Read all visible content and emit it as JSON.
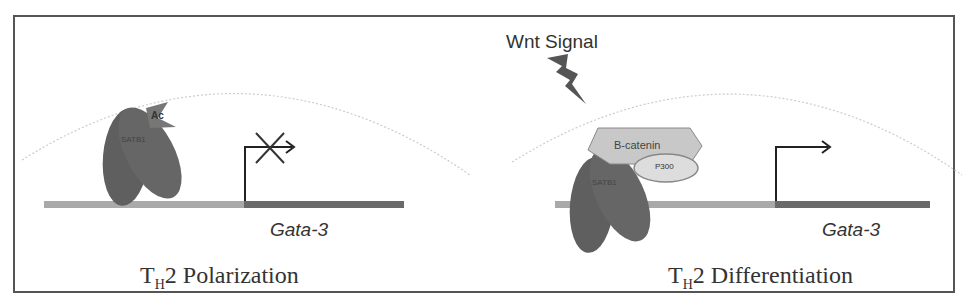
{
  "diagram": {
    "left_panel": {
      "title_prefix": "T",
      "title_sub": "H",
      "title_suffix": "2 Polarization",
      "protein_label": "SATB1",
      "modification_label": "Ac",
      "gene_label": "Gata-3",
      "transcription": "blocked"
    },
    "right_panel": {
      "title_prefix": "T",
      "title_sub": "H",
      "title_suffix": "2 Differentiation",
      "signal_label": "Wnt Signal",
      "protein_label": "SATB1",
      "cofactor_label": "B-catenin",
      "coactivator_label": "P300",
      "gene_label": "Gata-3",
      "transcription": "active"
    },
    "colors": {
      "protein": "#5f5f5f",
      "dna_promoter": "#a9a9a9",
      "dna_gene": "#6a6a6a",
      "cofactor": "#c8c8c8",
      "border": "#555555"
    }
  }
}
